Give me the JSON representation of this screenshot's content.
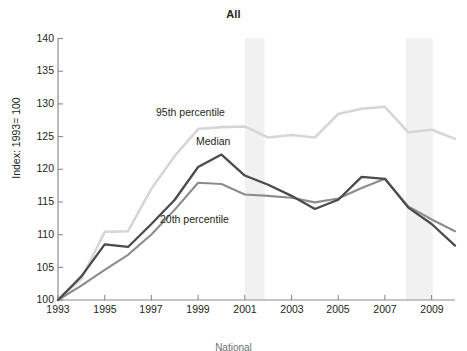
{
  "chart_data": {
    "type": "line",
    "title": "All",
    "xlabel": "",
    "ylabel": "Index: 1993= 100",
    "xlim": [
      1993,
      2010
    ],
    "ylim": [
      100,
      140
    ],
    "yticks": [
      100,
      105,
      110,
      115,
      120,
      125,
      130,
      135,
      140
    ],
    "xticks": [
      1993,
      1995,
      1997,
      1999,
      2001,
      2003,
      2005,
      2007,
      2009
    ],
    "grid": false,
    "legend_position": "inline-annotations",
    "x": [
      1993,
      1994,
      1995,
      1996,
      1997,
      1998,
      1999,
      2000,
      2001,
      2002,
      2003,
      2004,
      2005,
      2006,
      2007,
      2008,
      2009,
      2010
    ],
    "series": [
      {
        "name": "95th percentile",
        "color": "#d6d6d6",
        "values": [
          100.0,
          103.2,
          110.4,
          110.5,
          117.0,
          122.0,
          126.1,
          126.4,
          126.5,
          124.8,
          125.2,
          124.8,
          128.4,
          129.2,
          129.5,
          125.6,
          126.0,
          124.6
        ]
      },
      {
        "name": "Median",
        "color": "#4b4b4b",
        "values": [
          100.0,
          103.6,
          108.5,
          108.1,
          111.6,
          115.3,
          120.3,
          122.2,
          119.0,
          117.6,
          115.9,
          113.9,
          115.3,
          118.8,
          118.5,
          114.1,
          111.6,
          108.3
        ]
      },
      {
        "name": "20th percentile",
        "color": "#8c8c8c",
        "values": [
          100.0,
          102.2,
          104.6,
          106.9,
          110.0,
          113.8,
          117.9,
          117.7,
          116.1,
          115.9,
          115.6,
          114.9,
          115.5,
          117.1,
          118.5,
          114.3,
          112.3,
          110.5
        ]
      }
    ],
    "annotations": [
      {
        "name": "95th percentile",
        "text": "95th percentile",
        "x_px": 156,
        "y_px": 112
      },
      {
        "name": "Median",
        "text": "Median",
        "x_px": 195,
        "y_px": 142
      },
      {
        "name": "20th percentile",
        "text": "20th percentile",
        "x_px": 160,
        "y_px": 219
      }
    ],
    "shaded_bands": [
      {
        "name": "recession-2001",
        "from": 2001.0,
        "to": 2001.85,
        "color": "#f1f1f1"
      },
      {
        "name": "recession-2008",
        "from": 2007.9,
        "to": 2009.05,
        "color": "#f1f1f1"
      }
    ],
    "footnote": "National"
  }
}
